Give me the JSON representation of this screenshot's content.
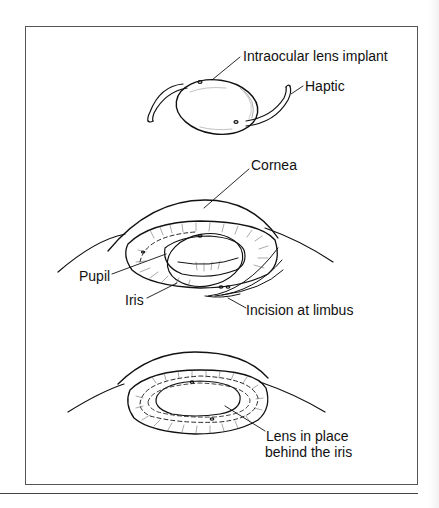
{
  "figure": {
    "labels": {
      "lens_implant": "Intraocular lens implant",
      "haptic": "Haptic",
      "cornea": "Cornea",
      "pupil": "Pupil",
      "iris": "Iris",
      "incision": "Incision at limbus",
      "lens_in_place_line1": "Lens in place",
      "lens_in_place_line2": "behind the iris"
    },
    "panels": [
      {
        "name": "intraocular-lens",
        "description": "Lens implant with two haptics"
      },
      {
        "name": "insertion",
        "description": "Lens inserted through incision at limbus"
      },
      {
        "name": "lens-in-place",
        "description": "Lens positioned behind the iris"
      }
    ],
    "colors": {
      "line": "#111111",
      "frame": "#555555",
      "background": "#ffffff"
    }
  }
}
